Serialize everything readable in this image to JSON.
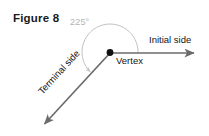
{
  "figure": {
    "caption": "Figure 8",
    "background_color": "#ffffff",
    "ray_color": "#6b6b6b",
    "arc_color": "#c2c2c2",
    "vertex_color": "#111111",
    "label_color": "#141414",
    "angle_label_color": "#b3b3b3"
  },
  "diagram": {
    "type": "angle-standard-position",
    "angle_measure": "225°",
    "vertex_label": "Vertex",
    "initial_side_label": "Initial side",
    "terminal_side_label": "Terminal side",
    "vertex_point": {
      "x": 110,
      "y": 52
    },
    "initial_side_end": {
      "x": 196,
      "y": 53
    },
    "terminal_side_end": {
      "x": 42,
      "y": 126
    },
    "arc_radius": 28,
    "rotation_direction": "counterclockwise"
  }
}
